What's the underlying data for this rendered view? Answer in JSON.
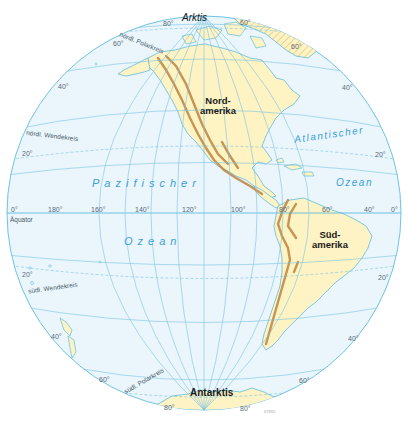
{
  "map": {
    "colors": {
      "ocean": "#eaf6fc",
      "land": "#fdf3c4",
      "coast": "#4fb4dd",
      "grid": "#7cc2e3",
      "mountains": "#c08a4a",
      "ice_hatch": "#e8c77a",
      "ocean_label": "#3aa0d8"
    },
    "regions": {
      "arctic": "Arktis",
      "antarctic": "Antarktis",
      "north_america": [
        "Nord-",
        "amerika"
      ],
      "south_america": [
        "Süd-",
        "amerika"
      ]
    },
    "oceans": {
      "pacific_1": "Pazifischer",
      "pacific_2": "Ozean",
      "atlantic_1": "Atlantischer",
      "atlantic_2": "Ozean"
    },
    "circles": {
      "arctic_circle": "nördl. Polarkreis",
      "tropic_cancer": "nördl. Wendekreis",
      "equator": "Äquator",
      "tropic_capricorn": "südl. Wendekreis",
      "antarctic_circle": "südl. Polarkreis"
    },
    "longitude_labels": [
      "0°",
      "180°",
      "160°",
      "140°",
      "120°",
      "100°",
      "80°",
      "60°",
      "40°",
      "0°"
    ],
    "latitude_labels": {
      "n80": "80°",
      "n60_left": "60°",
      "n60_right": "60°",
      "n60_top": "60°",
      "n40_left": "40°",
      "n40_right": "40°",
      "n20_left": "20°",
      "n20_right": "20°",
      "s20_left": "20°",
      "s20_right": "20°",
      "s40_left": "40°",
      "s40_right": "40°",
      "s60_left": "60°",
      "s60_right": "60°",
      "s80_left": "80°",
      "s80_right": "80°"
    },
    "code": "07855"
  }
}
